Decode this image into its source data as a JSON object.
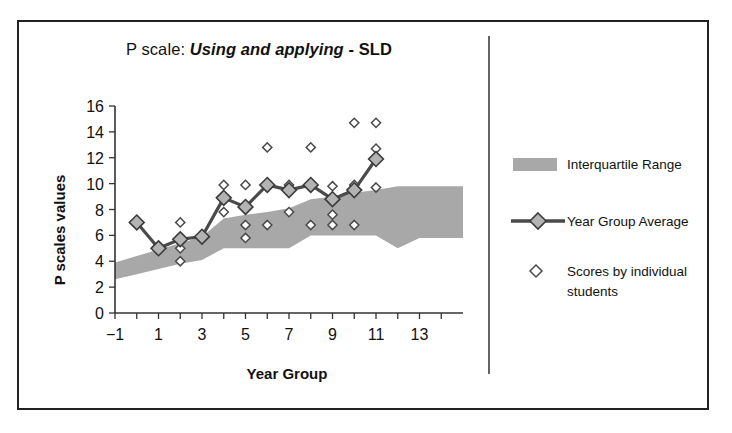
{
  "figure": {
    "title_plain": "P scale: ",
    "title_emphasis": "Using and applying",
    "title_tail": " - SLD"
  },
  "chart_data": {
    "type": "line",
    "title": "P scale: Using and applying - SLD",
    "xlabel": "Year Group",
    "ylabel": "P scales values",
    "xlim": [
      -1,
      15
    ],
    "ylim": [
      0,
      16
    ],
    "xticks": [
      -1,
      1,
      3,
      5,
      7,
      9,
      11,
      13
    ],
    "xticks_minor": [
      0,
      2,
      4,
      6,
      8,
      10,
      12,
      14
    ],
    "yticks": [
      0,
      2,
      4,
      6,
      8,
      10,
      12,
      14,
      16
    ],
    "grid": false,
    "legend_position": "right",
    "colors": {
      "band": "#a8a8a8",
      "line": "#4a4a4a",
      "marker_fill": "#b3b3b3",
      "scatter_fill": "#ffffff",
      "axis": "#333333",
      "frame": "#222222"
    },
    "series": [
      {
        "name": "Year Group Average",
        "type": "line",
        "x": [
          0,
          1,
          2,
          3,
          4,
          5,
          6,
          7,
          8,
          9,
          10,
          11
        ],
        "values": [
          7.0,
          5.0,
          5.7,
          5.9,
          8.9,
          8.2,
          9.9,
          9.5,
          9.9,
          8.8,
          9.5,
          11.9
        ]
      },
      {
        "name": "Interquartile Range",
        "type": "band",
        "x": [
          -1,
          0,
          1,
          2,
          3,
          4,
          5,
          6,
          7,
          8,
          9,
          10,
          11,
          12,
          13,
          14,
          15
        ],
        "lower": [
          2.6,
          3.0,
          3.4,
          3.8,
          4.1,
          5.0,
          5.0,
          5.0,
          5.0,
          6.0,
          6.0,
          6.0,
          6.0,
          5.0,
          5.8,
          5.8,
          5.8
        ],
        "upper": [
          3.9,
          4.4,
          4.9,
          5.4,
          5.9,
          7.3,
          7.6,
          7.8,
          8.1,
          8.8,
          9.0,
          9.3,
          9.5,
          9.8,
          9.8,
          9.8,
          9.8
        ]
      },
      {
        "name": "Scores by individual students",
        "type": "scatter",
        "points": [
          [
            0,
            7.0
          ],
          [
            1,
            5.0
          ],
          [
            2,
            7.0
          ],
          [
            2,
            5.0
          ],
          [
            2,
            4.0
          ],
          [
            3,
            5.9
          ],
          [
            4,
            9.9
          ],
          [
            4,
            7.8
          ],
          [
            4,
            8.9
          ],
          [
            5,
            9.9
          ],
          [
            5,
            8.2
          ],
          [
            5,
            6.8
          ],
          [
            5,
            5.8
          ],
          [
            6,
            12.8
          ],
          [
            6,
            9.8
          ],
          [
            6,
            6.8
          ],
          [
            7,
            9.9
          ],
          [
            7,
            9.4
          ],
          [
            7,
            7.8
          ],
          [
            8,
            12.8
          ],
          [
            8,
            9.9
          ],
          [
            8,
            6.8
          ],
          [
            9,
            9.8
          ],
          [
            9,
            8.8
          ],
          [
            9,
            7.6
          ],
          [
            9,
            6.8
          ],
          [
            10,
            14.7
          ],
          [
            10,
            9.9
          ],
          [
            10,
            9.4
          ],
          [
            10,
            6.8
          ],
          [
            11,
            14.7
          ],
          [
            11,
            12.7
          ],
          [
            11,
            12.0
          ],
          [
            11,
            9.7
          ]
        ]
      }
    ]
  },
  "legend": {
    "items": [
      {
        "label": "Interquartile Range",
        "marker": "band-swatch"
      },
      {
        "label": "Year Group Average",
        "marker": "line-diamond"
      },
      {
        "label": "Scores by individual students",
        "marker": "open-diamond"
      }
    ],
    "scores_line1": "Scores by individual",
    "scores_line2": "students"
  }
}
